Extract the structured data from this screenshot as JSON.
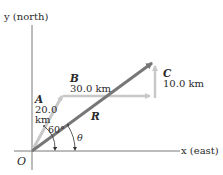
{
  "axes": {
    "y_label": "y (north)",
    "x_label": "x (east)",
    "origin_label": "O"
  },
  "vectors": {
    "A": {
      "name": "A",
      "magnitude": "20.0",
      "unit": "km",
      "color": "#c8c8c8"
    },
    "B": {
      "name": "B",
      "magnitude_label": "30.0 km",
      "color": "#c8c8c8"
    },
    "C": {
      "name": "C",
      "magnitude_label": "10.0 km",
      "color": "#c8c8c8"
    },
    "R": {
      "name": "R",
      "color": "#777777"
    }
  },
  "angles": {
    "A_angle": "60°",
    "R_angle": "θ"
  }
}
